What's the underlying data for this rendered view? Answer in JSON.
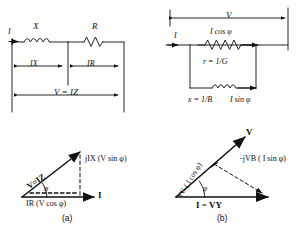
{
  "figure": {
    "ink_color": "#111111",
    "background": "#fdfdfb"
  },
  "panel_a_circuit": {
    "name": "series-circuit",
    "current_label": "I",
    "reactance_label": "X",
    "resistance_label": "R",
    "drop_reactance": "IX",
    "drop_resistance": "IR",
    "total_voltage": "V = IZ"
  },
  "panel_b_circuit": {
    "name": "parallel-circuit",
    "voltage_label": "V",
    "current_label": "I",
    "branch_resistive_current": "I cos φ",
    "branch_resistive_value": "r = 1/G",
    "branch_reactive_value": "x = 1/B",
    "branch_reactive_current": "I sin φ"
  },
  "panel_a_phasor": {
    "name": "series-phasor",
    "hypotenuse": "V=IZ",
    "vertical": "jIX (V sin φ)",
    "horizontal": "IR (V cos φ)",
    "axis": "I",
    "angle": "φ",
    "caption": "(a)"
  },
  "panel_b_phasor": {
    "name": "parallel-phasor",
    "hypotenuse": "V",
    "component_conductive": "VG ( I cos φ)",
    "component_susceptive": "-jVB ( I sin φ)",
    "axis": "I = VY",
    "angle": "φ",
    "caption": "(b)"
  }
}
